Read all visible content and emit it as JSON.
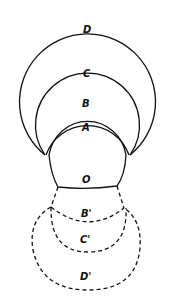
{
  "diagram": {
    "type": "nested-arc-diagram",
    "colors": {
      "stroke": "#111111",
      "background": "#ffffff"
    },
    "labels": {
      "D": "D",
      "C": "C",
      "B": "B",
      "A": "A",
      "O": "O",
      "B_prime": "B'",
      "C_prime": "C'",
      "D_prime": "D'"
    },
    "solid_arcs": [
      "D",
      "C",
      "B",
      "A",
      "O"
    ],
    "dashed_arcs": [
      "B'",
      "C'",
      "D'"
    ]
  }
}
